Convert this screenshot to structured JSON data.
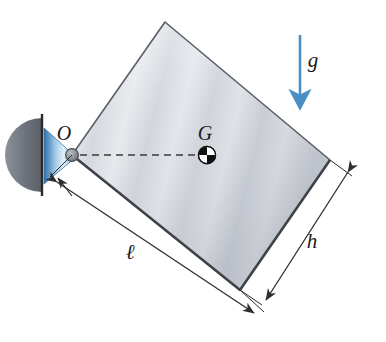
{
  "figure": {
    "canvas": {
      "width": 386,
      "height": 342,
      "background": "#ffffff"
    },
    "labels": {
      "pivot": "O",
      "center_of_mass": "G",
      "gravity": "g",
      "length": "ℓ",
      "height": "h"
    },
    "colors": {
      "plate_outline": "#4a4a4a",
      "plate_fill_light": "#eceef0",
      "plate_fill_mid": "#c9ccd2",
      "plate_fill_shadow": "#b2b6be",
      "gravity_arrow": "#4a8fc4",
      "wall_support": "#6b6f76",
      "cone_blue": "#5b9ad0",
      "hub": "#8b8f96",
      "dimension_line": "#3a3a3a",
      "dashed_line": "#3a3a3a",
      "text": "#1a1a1a"
    },
    "geometry": {
      "plate_corners": {
        "O": [
          72,
          155
        ],
        "top": [
          165,
          22
        ],
        "right": [
          330,
          160
        ],
        "bottom": [
          240,
          290
        ]
      },
      "center_of_mass_point": [
        207,
        155
      ],
      "gravity_arrow": {
        "x": 300,
        "y_start": 35,
        "y_end": 97
      },
      "wall_x": 42,
      "wall_y_top": 118,
      "wall_y_bottom": 192,
      "dimension_length_offset": 30,
      "dimension_height_offset": 26
    },
    "elements": [
      {
        "name": "plate",
        "kind": "rectangular-plate"
      },
      {
        "name": "pivot-support",
        "kind": "wall-bracket"
      },
      {
        "name": "gravity-vector",
        "kind": "arrow"
      },
      {
        "name": "center-of-mass-marker",
        "kind": "quadrant-circle"
      },
      {
        "name": "dimension-length",
        "kind": "dimension"
      },
      {
        "name": "dimension-height",
        "kind": "dimension"
      },
      {
        "name": "centerline",
        "kind": "dashed-line"
      }
    ]
  }
}
